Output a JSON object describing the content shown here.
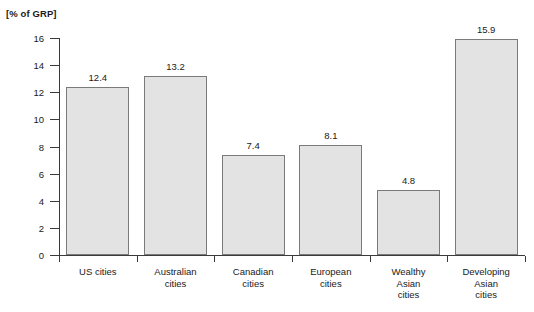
{
  "chart_data": {
    "type": "bar",
    "title": "",
    "subtitle": "",
    "xlabel": "",
    "ylabel": "[% of GRP]",
    "ylim": [
      0,
      16
    ],
    "ytick_step": 2,
    "yticks": [
      "16",
      "14",
      "12",
      "10",
      "8",
      "6",
      "4",
      "2",
      "0"
    ],
    "grid": false,
    "legend": null,
    "categories": [
      "US cities",
      "Australian\ncities",
      "Canadian\ncities",
      "European\ncities",
      "Wealthy\nAsian\ncities",
      "Developing\nAsian\ncities"
    ],
    "values": [
      12.4,
      13.2,
      7.4,
      8.1,
      4.8,
      15.9
    ],
    "value_labels": [
      "12.4",
      "13.2",
      "7.4",
      "8.1",
      "4.8",
      "15.9"
    ],
    "bar_fill": "#e3e3e3",
    "bar_stroke": "#7a7a7a",
    "axis_color": "#3a3a3a",
    "background": "#ffffff"
  }
}
